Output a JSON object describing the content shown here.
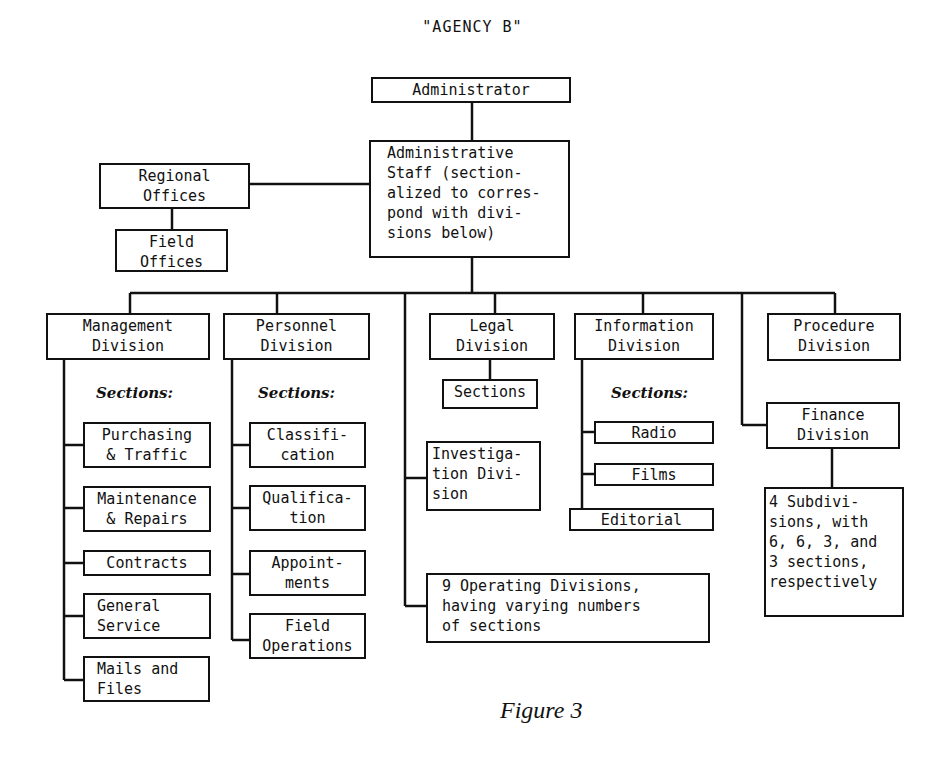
{
  "title": "\"AGENCY B\"",
  "caption": "Figure 3",
  "top": {
    "administrator": "Administrator",
    "administrative_staff": "Administrative\nStaff (section-\nalized to corres-\npond with divi-\nsions below)",
    "regional_offices": "Regional\nOffices",
    "field_offices": "Field\nOffices"
  },
  "divisions": {
    "management": {
      "label": "Management\nDivision",
      "sections_label": "Sections:",
      "sections": [
        "Purchasing\n& Traffic",
        "Maintenance\n& Repairs",
        "Contracts",
        "General\nService",
        "Mails and\nFiles"
      ]
    },
    "personnel": {
      "label": "Personnel\nDivision",
      "sections_label": "Sections:",
      "sections": [
        "Classifi-\ncation",
        "Qualifica-\ntion",
        "Appoint-\nments",
        "Field\nOperations"
      ]
    },
    "legal": {
      "label": "Legal\nDivision",
      "sections": "Sections"
    },
    "investigation": {
      "label": "Investiga-\ntion Divi-\nsion"
    },
    "operating": {
      "label": "9 Operating Divisions,\nhaving varying numbers\nof sections"
    },
    "information": {
      "label": "Information\nDivision",
      "sections_label": "Sections:",
      "sections": [
        "Radio",
        "Films",
        "Editorial"
      ]
    },
    "procedure": {
      "label": "Procedure\nDivision"
    },
    "finance": {
      "label": "Finance\nDivision",
      "subdivisions": "4 Subdivi-\nsions, with\n6, 6, 3, and\n3 sections,\nrespectively"
    }
  }
}
